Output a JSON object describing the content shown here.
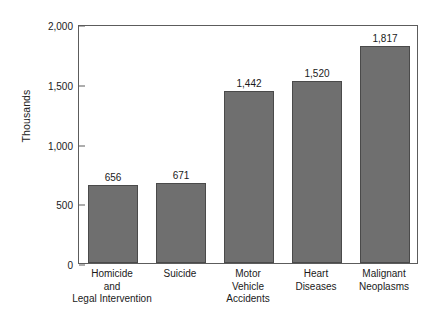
{
  "chart_data": {
    "type": "bar",
    "title": "",
    "xlabel": "",
    "ylabel": "Thousands",
    "ylim": [
      0,
      2000
    ],
    "yticks": [
      0,
      500,
      1000,
      1500,
      2000
    ],
    "ytick_labels": [
      "0",
      "500",
      "1,000",
      "1,500",
      "2,000"
    ],
    "grid": false,
    "legend": "none",
    "bar_color": "#6f6f6f",
    "bar_border_color": "#4a4a4a",
    "axis_color": "#5c5c5c",
    "background": "#ffffff",
    "categories": [
      "Homicide and Legal Intervention",
      "Suicide",
      "Motor Vehicle Accidents",
      "Heart Diseases",
      "Malignant Neoplasms"
    ],
    "category_lines": [
      [
        "Homicide",
        "and",
        "Legal Intervention"
      ],
      [
        "Suicide"
      ],
      [
        "Motor",
        "Vehicle",
        "Accidents"
      ],
      [
        "Heart",
        "Diseases"
      ],
      [
        "Malignant",
        "Neoplasms"
      ]
    ],
    "values": [
      656,
      671,
      1442,
      1520,
      1817
    ],
    "value_labels": [
      "656",
      "671",
      "1,442",
      "1,520",
      "1,817"
    ]
  }
}
